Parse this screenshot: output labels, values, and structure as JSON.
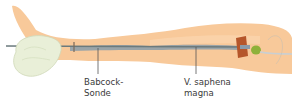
{
  "figure": {
    "colors": {
      "skin": "#f8c99a",
      "skin_light": "#fbd9b4",
      "vein": "#9aa4a8",
      "probe": "#6b7a7d",
      "bandage": "#e9efd8",
      "incision_pad": "#b5562a",
      "bulb": "#8fb13a",
      "leader_line": "#555555"
    },
    "labels": [
      {
        "line1": "Babcock-",
        "line2": "Sonde"
      },
      {
        "line1": "V. saphena",
        "line2": "magna"
      }
    ]
  }
}
